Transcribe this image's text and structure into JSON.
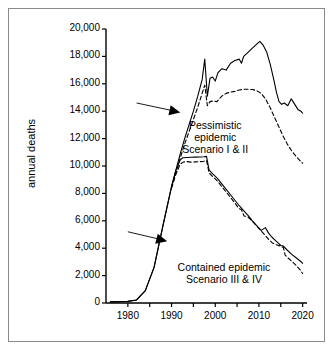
{
  "chart_data": {
    "type": "line",
    "title": "",
    "xlabel": "",
    "ylabel": "annual deaths",
    "xlim": [
      1975,
      2021
    ],
    "ylim": [
      0,
      20000
    ],
    "xticks": [
      1980,
      1990,
      2000,
      2010,
      2020
    ],
    "xticks_minor": [
      1985,
      1995,
      2005,
      2015
    ],
    "yticks": [
      0,
      2000,
      4000,
      6000,
      8000,
      10000,
      12000,
      14000,
      16000,
      18000,
      20000
    ],
    "ytick_labels": [
      "0",
      "2,000",
      "4,000",
      "6,000",
      "8,000",
      "10,000",
      "12,000",
      "14,000",
      "16,000",
      "18,000",
      "20,000"
    ],
    "xtick_labels": [
      "1980",
      "1990",
      "2000",
      "2010",
      "2020"
    ],
    "grid": false,
    "legend": "none",
    "annotations": [
      {
        "name": "pessimistic-label",
        "lines": [
          "Pessimistic",
          "epidemic",
          "Scenario I & II"
        ],
        "x": 2000,
        "y": 13000
      },
      {
        "name": "contained-label",
        "lines": [
          "Contained epidemic",
          "Scenario III & IV"
        ],
        "x": 2002,
        "y": 2600
      }
    ],
    "arrows": [
      {
        "name": "pessimistic-arrow",
        "from": [
          1982,
          14600
        ],
        "to": [
          1992,
          13900
        ]
      },
      {
        "name": "contained-arrow",
        "from": [
          1980,
          5200
        ],
        "to": [
          1989,
          4500
        ]
      }
    ],
    "series": [
      {
        "name": "Pessimistic epidemic Scenario I",
        "style": "solid",
        "color": "#000000",
        "x": [
          1976,
          1980,
          1982,
          1984,
          1986,
          1988,
          1990,
          1991,
          1992,
          1993,
          1994,
          1995,
          1996,
          1997,
          1997.6,
          1998.2,
          1998.8,
          1999.4,
          2000,
          2000.6,
          2001.5,
          2002.5,
          2003.5,
          2004.5,
          2005.5,
          2006,
          2006.5,
          2007.5,
          2008.5,
          2009.5,
          2010.2,
          2011,
          2011.8,
          2012.6,
          2013.4,
          2014,
          2014.6,
          2015.2,
          2015.8,
          2016.6,
          2017.4,
          2018.2,
          2019,
          2019.6,
          2020
        ],
        "y": [
          80,
          120,
          220,
          900,
          2600,
          5600,
          8500,
          9700,
          10900,
          12000,
          13000,
          14000,
          15100,
          16300,
          17800,
          15100,
          16400,
          16500,
          16200,
          16800,
          17100,
          17000,
          17500,
          17700,
          17800,
          17500,
          18000,
          18300,
          18600,
          18900,
          19100,
          18800,
          18300,
          17400,
          16300,
          15400,
          14700,
          14500,
          14600,
          14400,
          14900,
          14500,
          14100,
          14000,
          13850
        ]
      },
      {
        "name": "Pessimistic epidemic Scenario II",
        "style": "dashed",
        "color": "#000000",
        "x": [
          1990,
          1991,
          1992,
          1993,
          1994,
          1995,
          1996,
          1997,
          1997.6,
          1998.2,
          1998.8,
          1999.6,
          2000.4,
          2001.5,
          2002.5,
          2003.5,
          2004.5,
          2005.5,
          2006.5,
          2007.5,
          2008.5,
          2009.5,
          2010.5,
          2011.5,
          2012.5,
          2013.5,
          2014.5,
          2015.5,
          2016.5,
          2017.5,
          2018.5,
          2019.5,
          2020
        ],
        "y": [
          8400,
          9500,
          10600,
          11600,
          12500,
          13400,
          14300,
          15300,
          15900,
          14400,
          14700,
          14750,
          14700,
          15100,
          15300,
          15400,
          15450,
          15550,
          15600,
          15600,
          15580,
          15500,
          15300,
          14900,
          14300,
          13600,
          12900,
          12200,
          11600,
          11100,
          10700,
          10350,
          10200
        ]
      },
      {
        "name": "Contained epidemic Scenario III",
        "style": "solid",
        "color": "#000000",
        "x": [
          1976,
          1980,
          1982,
          1984,
          1986,
          1988,
          1990,
          1991,
          1992,
          1992.6,
          1993.5,
          1994.5,
          1995.5,
          1996.5,
          1997.4,
          1998,
          1998.6,
          1999.5,
          2000.5,
          2001.5,
          2002.5,
          2003.5,
          2004.5,
          2005.5,
          2006.5,
          2007.5,
          2008.5,
          2009.5,
          2010.5,
          2011.5,
          2012.2,
          2013,
          2014,
          2015,
          2015.6,
          2016.5,
          2017.5,
          2018.5,
          2019.5,
          2020
        ],
        "y": [
          80,
          120,
          220,
          900,
          2600,
          5600,
          8500,
          9700,
          10450,
          10600,
          10620,
          10640,
          10650,
          10660,
          10680,
          10700,
          9700,
          9400,
          9100,
          8700,
          8300,
          7900,
          7500,
          7100,
          6750,
          6400,
          6000,
          5650,
          5300,
          5500,
          5100,
          4800,
          4500,
          4200,
          4150,
          3850,
          3550,
          3300,
          3050,
          2900
        ]
      },
      {
        "name": "Contained epidemic Scenario IV",
        "style": "dashed",
        "color": "#000000",
        "x": [
          1990,
          1991,
          1992,
          1992.8,
          1993.6,
          1994.5,
          1995.5,
          1996.5,
          1997.4,
          1998,
          1998.6,
          1999.5,
          2000.5,
          2001.5,
          2002.5,
          2003.5,
          2004.5,
          2005.4,
          2006,
          2006.6,
          2007.4,
          2008.4,
          2009.4,
          2010.4,
          2011.4,
          2012.2,
          2013,
          2014,
          2015,
          2015.6,
          2016,
          2016.6,
          2017.5,
          2018.5,
          2019.5,
          2020
        ],
        "y": [
          8400,
          9400,
          10150,
          10300,
          10320,
          10280,
          10300,
          10320,
          10350,
          10400,
          9500,
          9200,
          8900,
          8500,
          8100,
          7700,
          7300,
          6900,
          6800,
          6350,
          6300,
          6000,
          5650,
          5300,
          4950,
          4650,
          4400,
          4250,
          4150,
          4050,
          3500,
          3300,
          3050,
          2750,
          2400,
          2150
        ]
      }
    ]
  }
}
